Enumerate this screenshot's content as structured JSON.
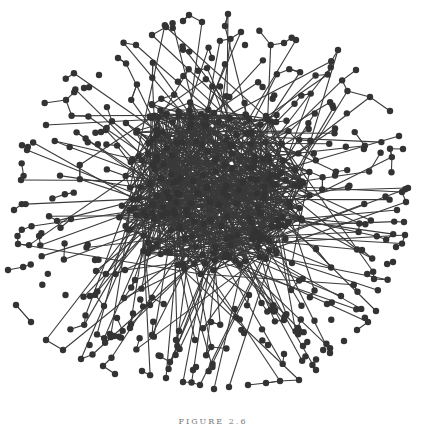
{
  "figure": {
    "type": "network-graph",
    "caption": "FIGURE 2.6",
    "colors": {
      "background": "#ffffff",
      "node": "#333333",
      "edge": "#3a3a3a",
      "caption": "#777777"
    },
    "node_radius": 3.2,
    "edge_width": 1.1,
    "layout": {
      "center": [
        211,
        205
      ],
      "core_radius": 95,
      "outer_radius": 200,
      "node_count_core": 230,
      "node_count_periphery": 260,
      "seed": 26
    },
    "anchor_nodes": [
      [
        189,
        15
      ],
      [
        202,
        22
      ],
      [
        228,
        14
      ],
      [
        241,
        32
      ],
      [
        225,
        26
      ],
      [
        245,
        45
      ],
      [
        284,
        43
      ],
      [
        296,
        40
      ],
      [
        338,
        50
      ],
      [
        356,
        70
      ],
      [
        370,
        97
      ],
      [
        390,
        111
      ],
      [
        399,
        136
      ],
      [
        403,
        149
      ],
      [
        408,
        188
      ],
      [
        402,
        192
      ],
      [
        406,
        202
      ],
      [
        397,
        210
      ],
      [
        404,
        222
      ],
      [
        396,
        247
      ],
      [
        405,
        235
      ],
      [
        393,
        262
      ],
      [
        374,
        279
      ],
      [
        376,
        311
      ],
      [
        368,
        322
      ],
      [
        357,
        330
      ],
      [
        344,
        341
      ],
      [
        330,
        353
      ],
      [
        316,
        370
      ],
      [
        299,
        380
      ],
      [
        280,
        381
      ],
      [
        266,
        383
      ],
      [
        248,
        385
      ],
      [
        229,
        387
      ],
      [
        214,
        389
      ],
      [
        200,
        385
      ],
      [
        183,
        382
      ],
      [
        166,
        378
      ],
      [
        142,
        371
      ],
      [
        115,
        374
      ],
      [
        103,
        366
      ],
      [
        81,
        359
      ],
      [
        63,
        350
      ],
      [
        46,
        340
      ],
      [
        31,
        322
      ],
      [
        16,
        305
      ],
      [
        8,
        270
      ],
      [
        18,
        244
      ],
      [
        14,
        210
      ],
      [
        21,
        180
      ],
      [
        27,
        150
      ],
      [
        46,
        125
      ],
      [
        66,
        100
      ],
      [
        84,
        88
      ],
      [
        99,
        75
      ],
      [
        118,
        58
      ],
      [
        136,
        45
      ],
      [
        152,
        35
      ],
      [
        166,
        27
      ],
      [
        183,
        21
      ],
      [
        71,
        219
      ],
      [
        96,
        271
      ],
      [
        104,
        306
      ],
      [
        117,
        318
      ],
      [
        95,
        260
      ],
      [
        90,
        296
      ],
      [
        135,
        280
      ],
      [
        150,
        305
      ],
      [
        152,
        335
      ],
      [
        124,
        298
      ],
      [
        114,
        336
      ],
      [
        125,
        270
      ],
      [
        176,
        340
      ],
      [
        170,
        362
      ],
      [
        193,
        370
      ],
      [
        195,
        340
      ],
      [
        211,
        322
      ],
      [
        244,
        333
      ],
      [
        275,
        310
      ],
      [
        303,
        346
      ],
      [
        284,
        354
      ],
      [
        341,
        296
      ],
      [
        327,
        304
      ],
      [
        249,
        295
      ],
      [
        292,
        263
      ],
      [
        258,
        247
      ],
      [
        316,
        249
      ],
      [
        362,
        250
      ],
      [
        298,
        328
      ],
      [
        268,
        345
      ],
      [
        291,
        290
      ]
    ]
  }
}
